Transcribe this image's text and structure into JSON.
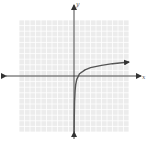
{
  "chart_data": {
    "type": "line",
    "title": "",
    "xlabel": "x",
    "ylabel": "y",
    "xlim": [
      -10,
      10
    ],
    "ylim": [
      -10,
      10
    ],
    "grid": true,
    "grid_step": 1,
    "series": [
      {
        "name": "f(x)",
        "color": "#555555",
        "x": [
          0.02,
          0.05,
          0.1,
          0.2,
          0.3,
          0.5,
          1,
          2,
          3,
          5,
          7,
          10
        ],
        "y": [
          -10,
          -7.5,
          -4.6,
          -2.6,
          -1.6,
          -0.6,
          0.4,
          1.1,
          1.5,
          1.9,
          2.2,
          2.5
        ]
      }
    ]
  },
  "colors": {
    "grid": "#d6d6d6",
    "grid_bg": "#ececec",
    "axis": "#333333",
    "curve": "#555555"
  }
}
